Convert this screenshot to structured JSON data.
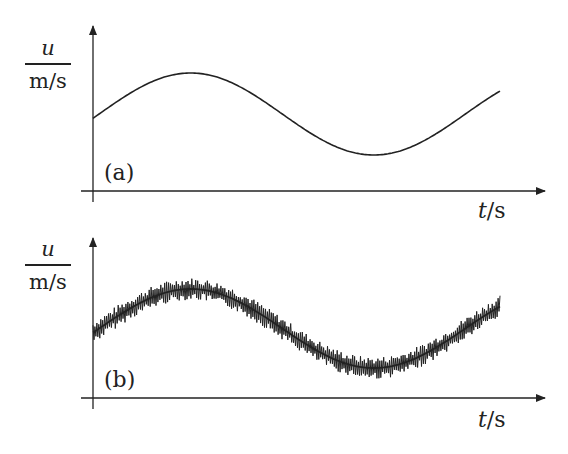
{
  "figure": {
    "panels": [
      {
        "tag": "(a)",
        "y_label_num": "u",
        "y_label_den": "m/s",
        "x_label_var": "t",
        "x_label_unit": "/s",
        "description": "smooth sinusoidal velocity"
      },
      {
        "tag": "(b)",
        "y_label_num": "u",
        "y_label_den": "m/s",
        "x_label_var": "t",
        "x_label_unit": "/s",
        "description": "sinusoidal velocity with high-frequency turbulent fluctuations"
      }
    ],
    "line_color": "#222222"
  },
  "chart_data": [
    {
      "type": "line",
      "title": "(a)",
      "xlabel": "t/s",
      "ylabel": "u / (m/s)",
      "grid": false,
      "legend": null,
      "ticks": "none",
      "series": [
        {
          "name": "mean velocity",
          "x": [
            0,
            0.1,
            0.2,
            0.3,
            0.4,
            0.5,
            0.6,
            0.7,
            0.8,
            0.9,
            1.0
          ],
          "values": [
            0.45,
            0.62,
            0.72,
            0.7,
            0.55,
            0.35,
            0.18,
            0.08,
            0.12,
            0.28,
            0.52
          ]
        }
      ]
    },
    {
      "type": "line",
      "title": "(b)",
      "xlabel": "t/s",
      "ylabel": "u / (m/s)",
      "grid": false,
      "legend": null,
      "ticks": "none",
      "series": [
        {
          "name": "mean velocity",
          "x": [
            0,
            0.1,
            0.2,
            0.3,
            0.4,
            0.5,
            0.6,
            0.7,
            0.8,
            0.9,
            1.0
          ],
          "values": [
            0.45,
            0.62,
            0.72,
            0.7,
            0.55,
            0.35,
            0.18,
            0.08,
            0.12,
            0.28,
            0.52
          ]
        },
        {
          "name": "instantaneous velocity (mean + fluctuation)",
          "fluctuation_amplitude": 0.08,
          "note": "high-frequency noise superimposed on mean curve"
        }
      ]
    }
  ]
}
